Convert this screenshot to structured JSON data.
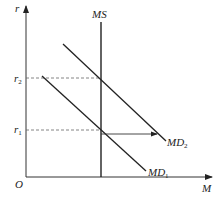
{
  "diagram": {
    "axes": {
      "y_label": "r",
      "x_label": "M",
      "origin_label": "O"
    },
    "curves": {
      "supply": {
        "label": "MS"
      },
      "demand_1": {
        "label_main": "MD",
        "label_sub": "1"
      },
      "demand_2": {
        "label_main": "MD",
        "label_sub": "2"
      }
    },
    "levels": {
      "r1": {
        "label_main": "r",
        "label_sub": "1"
      },
      "r2": {
        "label_main": "r",
        "label_sub": "2"
      }
    },
    "shift_arrow": {
      "from": "MD1",
      "to": "MD2",
      "direction": "right"
    },
    "colors": {
      "line": "#222222",
      "dashed": "#666666"
    }
  }
}
